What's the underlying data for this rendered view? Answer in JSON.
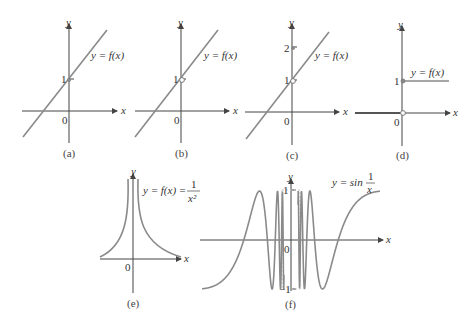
{
  "figure": {
    "panels": [
      {
        "id": "a",
        "caption": "(a)",
        "function_label": "y = f(x)",
        "y_axis_label": "y",
        "x_axis_label": "x",
        "origin_label": "0",
        "y_ticks": [
          "1"
        ],
        "note": "line through (0,1), point on line"
      },
      {
        "id": "b",
        "caption": "(b)",
        "function_label": "y = f(x)",
        "y_axis_label": "y",
        "x_axis_label": "x",
        "origin_label": "0",
        "y_ticks": [
          "1"
        ],
        "note": "line with hole (open circle) at (0,1)"
      },
      {
        "id": "c",
        "caption": "(c)",
        "function_label": "y = f(x)",
        "y_axis_label": "y",
        "x_axis_label": "x",
        "origin_label": "0",
        "y_ticks": [
          "1",
          "2"
        ],
        "note": "line with hole at (0,1), filled point at (0,2)"
      },
      {
        "id": "d",
        "caption": "(d)",
        "function_label": "y = f(x)",
        "y_axis_label": "y",
        "x_axis_label": "x",
        "origin_label": "0",
        "y_ticks": [
          "1"
        ],
        "note": "step function: 0 for x<0, 1 for x>=0"
      },
      {
        "id": "e",
        "caption": "(e)",
        "function_label_prefix": "y = f(x) =",
        "fraction_numerator": "1",
        "fraction_denominator": "x²",
        "y_axis_label": "y",
        "x_axis_label": "x",
        "origin_label": "0",
        "note": "1/x^2 vertical asymptote at x=0"
      },
      {
        "id": "f",
        "caption": "(f)",
        "function_label_prefix": "y = sin",
        "fraction_numerator": "1",
        "fraction_denominator": "x",
        "y_axis_label": "y",
        "x_axis_label": "x",
        "origin_label": "0",
        "y_ticks": [
          "1",
          "−1"
        ],
        "note": "sin(1/x) oscillating near x=0"
      }
    ]
  }
}
